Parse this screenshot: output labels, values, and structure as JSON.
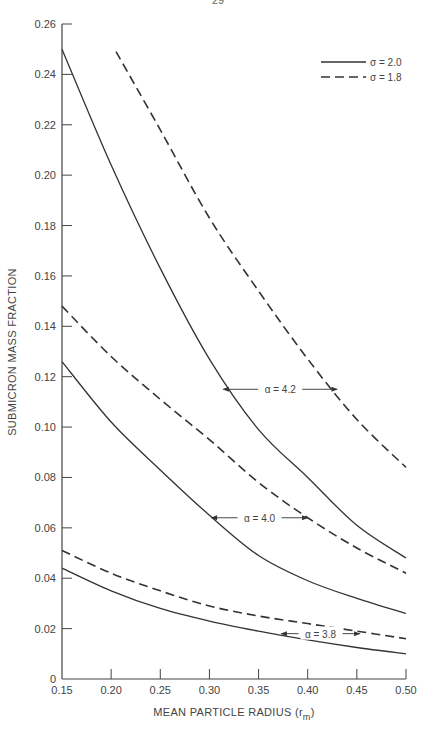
{
  "page": {
    "number": "29"
  },
  "chart_data": {
    "type": "line",
    "title": "",
    "xlabel": "MEAN PARTICLE RADIUS (r",
    "xlabel_sub": "m",
    "xlabel_close": ")",
    "ylabel": "SUBMICRON MASS FRACTION",
    "xlim": [
      0.15,
      0.5
    ],
    "ylim": [
      0,
      0.26
    ],
    "x_ticks": [
      "0.15",
      "0.20",
      "0.25",
      "0.30",
      "0.35",
      "0.40",
      "0.45",
      "0.50"
    ],
    "y_ticks": [
      "0",
      "0.02",
      "0.04",
      "0.06",
      "0.08",
      "0.10",
      "0.12",
      "0.14",
      "0.16",
      "0.18",
      "0.20",
      "0.22",
      "0.24",
      "0.26"
    ],
    "grid": false,
    "legend": [
      {
        "label": "σ = 2.0",
        "style": "solid"
      },
      {
        "label": "σ = 1.8",
        "style": "dashed"
      }
    ],
    "legend_position": "top-right",
    "series": [
      {
        "name": "α = 4.2, σ = 2.0",
        "style": "solid",
        "x": [
          0.15,
          0.2,
          0.25,
          0.3,
          0.35,
          0.4,
          0.45,
          0.5
        ],
        "y": [
          0.25,
          0.204,
          0.163,
          0.127,
          0.099,
          0.08,
          0.061,
          0.048
        ]
      },
      {
        "name": "α = 4.2, σ = 1.8",
        "style": "dashed",
        "x": [
          0.205,
          0.25,
          0.3,
          0.35,
          0.4,
          0.45,
          0.5
        ],
        "y": [
          0.249,
          0.218,
          0.183,
          0.154,
          0.127,
          0.103,
          0.084
        ]
      },
      {
        "name": "α = 4.0, σ = 2.0",
        "style": "solid",
        "x": [
          0.15,
          0.2,
          0.25,
          0.3,
          0.35,
          0.4,
          0.45,
          0.5
        ],
        "y": [
          0.126,
          0.102,
          0.083,
          0.065,
          0.049,
          0.039,
          0.032,
          0.026
        ]
      },
      {
        "name": "α = 4.0, σ = 1.8",
        "style": "dashed",
        "x": [
          0.15,
          0.2,
          0.25,
          0.3,
          0.35,
          0.4,
          0.45,
          0.5
        ],
        "y": [
          0.148,
          0.128,
          0.111,
          0.095,
          0.078,
          0.064,
          0.052,
          0.042
        ]
      },
      {
        "name": "α = 3.8, σ = 2.0",
        "style": "solid",
        "x": [
          0.15,
          0.2,
          0.25,
          0.3,
          0.35,
          0.4,
          0.45,
          0.5
        ],
        "y": [
          0.044,
          0.035,
          0.028,
          0.023,
          0.019,
          0.0155,
          0.0125,
          0.01
        ]
      },
      {
        "name": "α = 3.8, σ = 1.8",
        "style": "dashed",
        "x": [
          0.15,
          0.2,
          0.25,
          0.3,
          0.35,
          0.4,
          0.45,
          0.5
        ],
        "y": [
          0.051,
          0.042,
          0.035,
          0.029,
          0.025,
          0.022,
          0.019,
          0.016
        ]
      }
    ],
    "annotations": [
      {
        "text": "α = 4.2",
        "x_from": 0.314,
        "x_to": 0.43,
        "y": 0.115
      },
      {
        "text": "α = 4.0",
        "x_from": 0.302,
        "x_to": 0.4,
        "y": 0.064
      },
      {
        "text": "α = 3.8",
        "x_from": 0.373,
        "x_to": 0.453,
        "y": 0.018
      }
    ]
  }
}
